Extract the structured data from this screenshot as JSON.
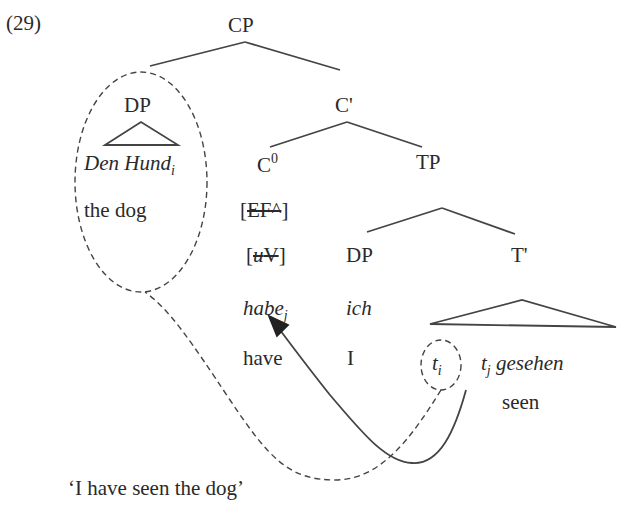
{
  "example_number": "(29)",
  "tree": {
    "root": "CP",
    "spec_cp": {
      "label": "DP",
      "word": "Den Hund",
      "index": "i",
      "gloss": "the dog"
    },
    "c_bar": "C'",
    "c_head": {
      "label": "C",
      "superscript": "0",
      "feature1": "EF^",
      "feature2": "uV",
      "word": "habe",
      "index": "j",
      "gloss": "have"
    },
    "tp": "TP",
    "spec_tp": {
      "label": "DP",
      "word": "ich",
      "gloss": "I"
    },
    "t_bar": "T'",
    "t_bar_content": {
      "trace1": "t",
      "trace1_index": "i",
      "trace2": "t",
      "trace2_index": "j",
      "verb": "gesehen",
      "gloss": "seen"
    }
  },
  "translation": "‘I have seen the dog’",
  "colors": {
    "ink": "#2a2a2a",
    "lines": "#444444"
  }
}
